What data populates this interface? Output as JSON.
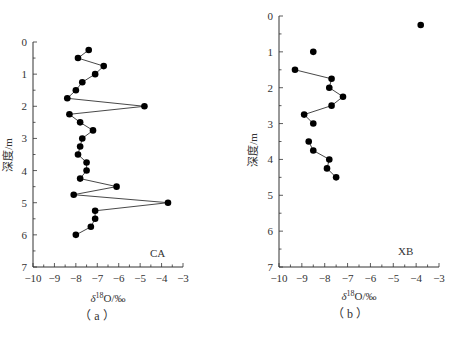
{
  "chart_data": [
    {
      "type": "line",
      "id": "a",
      "panel_label": "CA",
      "caption": "（ a ）",
      "xlabel": "δ18O/‰",
      "ylabel": "深度/m",
      "xlim": [
        -10,
        -3
      ],
      "ylim": [
        7,
        0
      ],
      "y_inverted": true,
      "xticks": [
        -10,
        -9,
        -8,
        -7,
        -6,
        -5,
        -4,
        -3
      ],
      "yticks": [
        0,
        1,
        2,
        3,
        4,
        5,
        6,
        7
      ],
      "grid": false,
      "series": [
        {
          "name": "CA",
          "segments": [
            [
              {
                "x": -7.4,
                "y": 0.25
              },
              {
                "x": -7.9,
                "y": 0.5
              },
              {
                "x": -6.7,
                "y": 0.75
              },
              {
                "x": -7.1,
                "y": 1.0
              },
              {
                "x": -7.7,
                "y": 1.25
              },
              {
                "x": -8.0,
                "y": 1.5
              },
              {
                "x": -8.4,
                "y": 1.75
              },
              {
                "x": -4.8,
                "y": 2.0
              },
              {
                "x": -8.3,
                "y": 2.25
              },
              {
                "x": -7.8,
                "y": 2.5
              },
              {
                "x": -7.2,
                "y": 2.75
              },
              {
                "x": -7.7,
                "y": 3.0
              },
              {
                "x": -7.8,
                "y": 3.25
              },
              {
                "x": -7.9,
                "y": 3.5
              },
              {
                "x": -7.5,
                "y": 3.75
              },
              {
                "x": -7.5,
                "y": 4.0
              },
              {
                "x": -7.8,
                "y": 4.25
              },
              {
                "x": -6.1,
                "y": 4.5
              },
              {
                "x": -8.1,
                "y": 4.75
              },
              {
                "x": -3.7,
                "y": 5.0
              },
              {
                "x": -7.1,
                "y": 5.25
              },
              {
                "x": -7.1,
                "y": 5.5
              },
              {
                "x": -7.3,
                "y": 5.75
              },
              {
                "x": -8.0,
                "y": 6.0
              }
            ]
          ]
        }
      ]
    },
    {
      "type": "line",
      "id": "b",
      "panel_label": "XB",
      "caption": "（ b ）",
      "xlabel": "δ18O/‰",
      "ylabel": "深度/m",
      "xlim": [
        -10,
        -3
      ],
      "ylim": [
        7,
        0
      ],
      "y_inverted": true,
      "xticks": [
        -10,
        -9,
        -8,
        -7,
        -6,
        -5,
        -4,
        -3
      ],
      "yticks": [
        0,
        1,
        2,
        3,
        4,
        5,
        6,
        7
      ],
      "grid": false,
      "series": [
        {
          "name": "XB",
          "segments": [
            [
              {
                "x": -3.8,
                "y": 0.25
              }
            ],
            [
              {
                "x": -8.5,
                "y": 1.0
              }
            ],
            [
              {
                "x": -9.3,
                "y": 1.5
              },
              {
                "x": -7.7,
                "y": 1.75
              },
              {
                "x": -7.8,
                "y": 2.0
              },
              {
                "x": -7.2,
                "y": 2.25
              },
              {
                "x": -7.7,
                "y": 2.5
              },
              {
                "x": -8.9,
                "y": 2.75
              },
              {
                "x": -8.5,
                "y": 3.0
              }
            ],
            [
              {
                "x": -8.7,
                "y": 3.5
              },
              {
                "x": -8.5,
                "y": 3.75
              },
              {
                "x": -7.8,
                "y": 4.0
              },
              {
                "x": -7.9,
                "y": 4.25
              },
              {
                "x": -7.5,
                "y": 4.5
              }
            ]
          ]
        }
      ]
    }
  ],
  "axis_title": {
    "x_prefix": "δ",
    "x_sup": "18",
    "x_suffix": "O/‰",
    "y": "深度/m"
  },
  "style": {
    "marker_color": "#000000",
    "line_color": "#333333",
    "axis_color": "#333333"
  }
}
